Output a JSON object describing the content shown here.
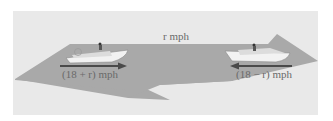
{
  "diagram": {
    "current_label": "r mph",
    "left_boat": {
      "label": "(18 + r) mph",
      "direction": "right"
    },
    "right_boat": {
      "label": "(18 − r) mph",
      "direction": "left"
    },
    "colors": {
      "background_panel": "#e9e9e9",
      "river": "#a9a9a9",
      "arrow": "#4a4a4a",
      "boat": "#f2f2f2",
      "text": "#6a6a6a"
    }
  }
}
